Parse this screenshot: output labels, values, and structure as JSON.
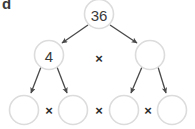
{
  "figure": {
    "panel_letter": "d",
    "type": "factor-tree",
    "colors": {
      "circle_stroke": "#dcdcdc",
      "circle_fill": "#ffffff",
      "text": "#3a3a3a",
      "arrow": "#4a4a4a",
      "background": "#ffffff"
    },
    "nodes": {
      "root": {
        "label": "36",
        "cx": 99,
        "cy": 14,
        "r": 14.5
      },
      "level2_left": {
        "label": "4",
        "cx": 49,
        "cy": 55,
        "r": 14.5
      },
      "level2_right": {
        "label": "",
        "cx": 150,
        "cy": 55,
        "r": 14.5
      },
      "level3_1": {
        "label": "",
        "cx": 24,
        "cy": 110,
        "r": 14.5
      },
      "level3_2": {
        "label": "",
        "cx": 73,
        "cy": 110,
        "r": 14.5
      },
      "level3_3": {
        "label": "",
        "cx": 124,
        "cy": 110,
        "r": 14.5
      },
      "level3_4": {
        "label": "",
        "cx": 172,
        "cy": 110,
        "r": 14.5
      }
    },
    "operators": {
      "level2_times": {
        "symbol": "×",
        "x": 99,
        "y": 58
      },
      "level3_times_1": {
        "symbol": "×",
        "x": 49,
        "y": 110
      },
      "level3_times_2": {
        "symbol": "×",
        "x": 99,
        "y": 110
      },
      "level3_times_3": {
        "symbol": "×",
        "x": 148,
        "y": 110
      }
    },
    "arrows": [
      {
        "name": "root-to-left",
        "x1": 88,
        "y1": 25,
        "x2": 61,
        "y2": 44
      },
      {
        "name": "root-to-right",
        "x1": 110,
        "y1": 25,
        "x2": 138,
        "y2": 44
      },
      {
        "name": "left-to-child1",
        "x1": 41,
        "y1": 67,
        "x2": 30,
        "y2": 95
      },
      {
        "name": "left-to-child2",
        "x1": 57,
        "y1": 67,
        "x2": 68,
        "y2": 95
      },
      {
        "name": "right-to-child3",
        "x1": 142,
        "y1": 67,
        "x2": 130,
        "y2": 95
      },
      {
        "name": "right-to-child4",
        "x1": 158,
        "y1": 67,
        "x2": 167,
        "y2": 95
      }
    ]
  }
}
